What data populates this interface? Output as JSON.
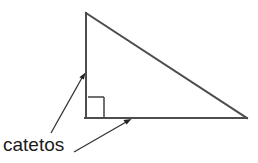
{
  "figure": {
    "type": "geometry-diagram",
    "background_color": "#ffffff",
    "stroke_color": "#4d4d4d",
    "annotation_color": "#333333",
    "text_color": "#1a1a1a",
    "labels": {
      "legs": "catetos"
    },
    "triangle": {
      "name": "right-triangle",
      "vertices": {
        "apex": {
          "x": 86,
          "y": 13
        },
        "right_angle": {
          "x": 86,
          "y": 118
        },
        "base_right": {
          "x": 247,
          "y": 118
        }
      },
      "sides": [
        {
          "name": "vertical-leg",
          "from": "apex",
          "to": "right_angle"
        },
        {
          "name": "horizontal-leg",
          "from": "right_angle",
          "to": "base_right"
        },
        {
          "name": "hypotenuse",
          "from": "apex",
          "to": "base_right"
        }
      ]
    },
    "right_angle_marker": {
      "name": "right-angle-square",
      "x": 88,
      "y": 97,
      "size": 16
    },
    "arrows": [
      {
        "name": "arrow-to-vertical-leg",
        "from": {
          "x": 51,
          "y": 133
        },
        "to": {
          "x": 85,
          "y": 73
        }
      },
      {
        "name": "arrow-to-horizontal-leg",
        "from": {
          "x": 74,
          "y": 152
        },
        "to": {
          "x": 131,
          "y": 119
        }
      }
    ]
  }
}
